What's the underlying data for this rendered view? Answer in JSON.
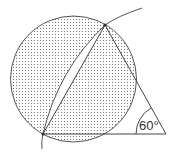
{
  "diagram": {
    "type": "geometry",
    "angle_label": "60°",
    "colors": {
      "stroke": "#444444",
      "shading_dot": "#7a7a7a",
      "background": "#ffffff"
    },
    "elements": {
      "circle": {
        "cx": 73.5,
        "cy": 79,
        "r": 63,
        "shaded": true
      },
      "triangle_apex": {
        "x": 105,
        "y": 25
      },
      "triangle_base_left": {
        "x": 43,
        "y": 134
      },
      "triangle_base_right": {
        "x": 166,
        "y": 134
      },
      "arc": {
        "description": "circular arc through apex and base-left vertex, unshaded lens between arc and chord"
      }
    }
  }
}
